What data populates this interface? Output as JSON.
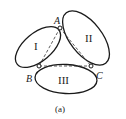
{
  "diagram": {
    "bodies": [
      {
        "id": "body-1",
        "label": "I"
      },
      {
        "id": "body-2",
        "label": "II"
      },
      {
        "id": "body-3",
        "label": "III"
      }
    ],
    "joints": [
      {
        "id": "joint-a",
        "label": "A"
      },
      {
        "id": "joint-b",
        "label": "B"
      },
      {
        "id": "joint-c",
        "label": "C"
      }
    ],
    "caption": "(a)",
    "colors": {
      "stroke": "#1a1a1a",
      "background": "#ffffff"
    }
  }
}
